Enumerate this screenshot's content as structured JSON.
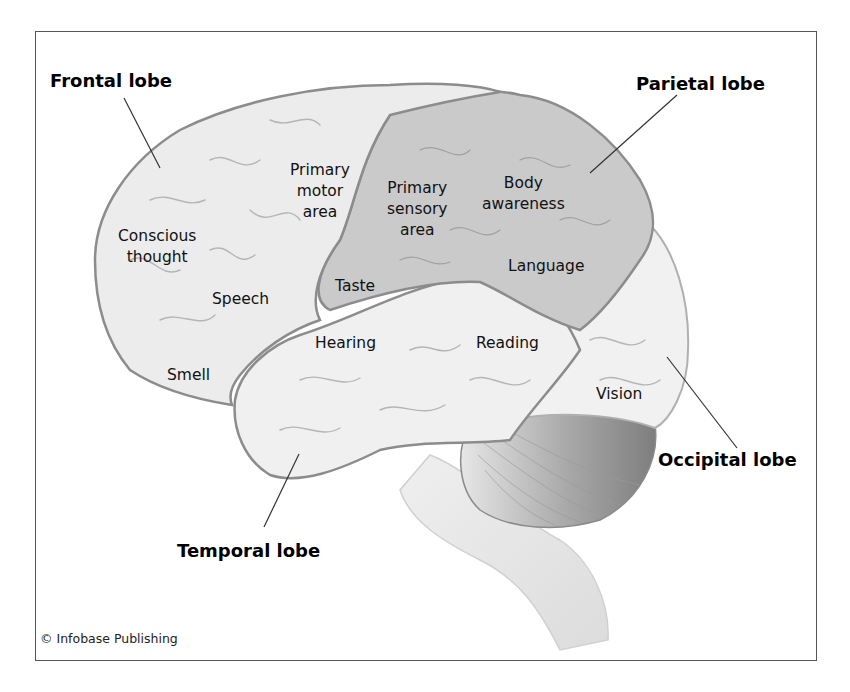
{
  "figure": {
    "credit": "© Infobase Publishing",
    "lobes": [
      {
        "id": "frontal",
        "label": "Frontal lobe"
      },
      {
        "id": "parietal",
        "label": "Parietal lobe"
      },
      {
        "id": "temporal",
        "label": "Temporal lobe"
      },
      {
        "id": "occipital",
        "label": "Occipital lobe"
      }
    ],
    "areas": [
      {
        "id": "conscious-thought",
        "label": "Conscious\nthought",
        "lobe": "frontal"
      },
      {
        "id": "primary-motor-area",
        "label": "Primary\nmotor\narea",
        "lobe": "frontal"
      },
      {
        "id": "speech",
        "label": "Speech",
        "lobe": "frontal"
      },
      {
        "id": "smell",
        "label": "Smell",
        "lobe": "frontal"
      },
      {
        "id": "primary-sensory-area",
        "label": "Primary\nsensory\narea",
        "lobe": "parietal"
      },
      {
        "id": "body-awareness",
        "label": "Body\nawareness",
        "lobe": "parietal"
      },
      {
        "id": "language",
        "label": "Language",
        "lobe": "parietal"
      },
      {
        "id": "taste",
        "label": "Taste",
        "lobe": "parietal"
      },
      {
        "id": "hearing",
        "label": "Hearing",
        "lobe": "temporal"
      },
      {
        "id": "reading",
        "label": "Reading",
        "lobe": "temporal"
      },
      {
        "id": "vision",
        "label": "Vision",
        "lobe": "occipital"
      }
    ],
    "colors": {
      "frontal": "#ececec",
      "parietal": "#c9c9c9",
      "temporal": "#f0f0f0",
      "occipital": "#f2f2f2",
      "cerebellum": "#8a8a8a",
      "outline": "#8c8c8c",
      "leader": "#333333"
    }
  }
}
